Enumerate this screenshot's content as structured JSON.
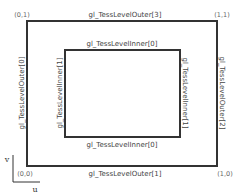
{
  "diagram": {
    "colors": {
      "stroke": "#333333",
      "text": "#444444",
      "corner_text": "#666666"
    },
    "corners": {
      "top_left": "(0,1)",
      "top_right": "(1,1)",
      "bottom_left": "(0,0)",
      "bottom_right": "(1,0)"
    },
    "outer": {
      "top": "gl_TessLevelOuter[3]",
      "left": "gl_TessLevelOuter[0]",
      "right": "gl_TessLevelOuter[2]",
      "bottom": "gl_TessLevelOuter[1]"
    },
    "inner": {
      "top": "gl_TessLevelInner[0]",
      "left": "gl_TessLevelInner[1]",
      "right": "gl_TessLevelInner[1]",
      "bottom": "gl_TessLevelInner[0]"
    },
    "axes": {
      "u": "u",
      "v": "v"
    }
  }
}
